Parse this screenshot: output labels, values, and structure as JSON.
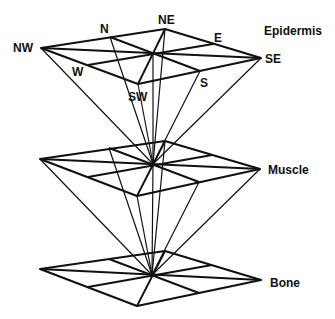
{
  "diagram": {
    "type": "stacked-planes",
    "layers": [
      {
        "name": "Epidermis",
        "y_offset": 0
      },
      {
        "name": "Muscle",
        "y_offset": 111
      },
      {
        "name": "Bone",
        "y_offset": 222
      }
    ],
    "directions": {
      "nw": "NW",
      "n": "N",
      "ne": "NE",
      "e": "E",
      "se": "SE",
      "s": "S",
      "sw": "SW",
      "w": "W"
    },
    "colors": {
      "line": "#111111",
      "background": "#ffffff"
    }
  }
}
